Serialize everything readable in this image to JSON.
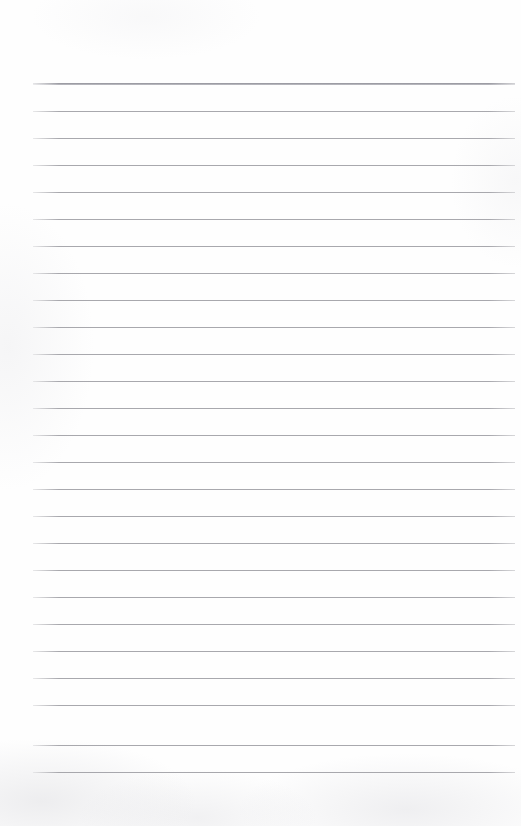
{
  "document": {
    "kind": "blank-lined-notebook-page",
    "page_width": 521,
    "page_height": 826,
    "background_color": "#fefefe",
    "text_content": "",
    "header_text": "",
    "footer_text": "",
    "page_number": "",
    "margin_top": 84,
    "margin_bottom": 54,
    "margin_left": 33,
    "margin_right": 6
  },
  "ruling": {
    "line_count": 26,
    "first_line_y": 84,
    "line_spacing": 27.05,
    "line_start_x": 33,
    "line_end_x": 515,
    "line_length": 482,
    "line_color": "#9a9aa0",
    "line_thickness": 1,
    "first_line_color": "#8a8a92",
    "first_line_thickness": 2,
    "first_line_emphasis": true,
    "margin_rule_present": false,
    "lines": [
      {
        "index": 1,
        "y": 84,
        "emphasis": true
      },
      {
        "index": 2,
        "y": 111,
        "emphasis": false
      },
      {
        "index": 3,
        "y": 138,
        "emphasis": false
      },
      {
        "index": 4,
        "y": 165,
        "emphasis": false
      },
      {
        "index": 5,
        "y": 192,
        "emphasis": false
      },
      {
        "index": 6,
        "y": 219,
        "emphasis": false
      },
      {
        "index": 7,
        "y": 246,
        "emphasis": false
      },
      {
        "index": 8,
        "y": 273,
        "emphasis": false
      },
      {
        "index": 9,
        "y": 300,
        "emphasis": false
      },
      {
        "index": 10,
        "y": 327,
        "emphasis": false
      },
      {
        "index": 11,
        "y": 354,
        "emphasis": false
      },
      {
        "index": 12,
        "y": 381,
        "emphasis": false
      },
      {
        "index": 13,
        "y": 408,
        "emphasis": false
      },
      {
        "index": 14,
        "y": 435,
        "emphasis": false
      },
      {
        "index": 15,
        "y": 462,
        "emphasis": false
      },
      {
        "index": 16,
        "y": 489,
        "emphasis": false
      },
      {
        "index": 17,
        "y": 516,
        "emphasis": false
      },
      {
        "index": 18,
        "y": 543,
        "emphasis": false
      },
      {
        "index": 19,
        "y": 570,
        "emphasis": false
      },
      {
        "index": 20,
        "y": 597,
        "emphasis": false
      },
      {
        "index": 21,
        "y": 624,
        "emphasis": false
      },
      {
        "index": 22,
        "y": 651,
        "emphasis": false
      },
      {
        "index": 23,
        "y": 678,
        "emphasis": false
      },
      {
        "index": 24,
        "y": 705,
        "emphasis": false
      },
      {
        "index": 25,
        "y": 745,
        "emphasis": false
      },
      {
        "index": 26,
        "y": 772,
        "emphasis": false
      }
    ]
  }
}
